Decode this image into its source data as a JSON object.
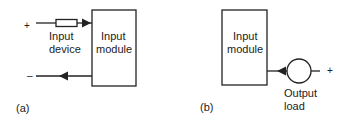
{
  "panel_a": {
    "caption": "(a)",
    "plus": "+",
    "minus": "–",
    "device_label_1": "Input",
    "device_label_2": "device",
    "module_label_1": "Input",
    "module_label_2": "module"
  },
  "panel_b": {
    "caption": "(b)",
    "plus": "+",
    "module_label_1": "Input",
    "module_label_2": "module",
    "load_label_1": "Output",
    "load_label_2": "load"
  },
  "colors": {
    "line": "#222222",
    "background": "#ffffff"
  }
}
